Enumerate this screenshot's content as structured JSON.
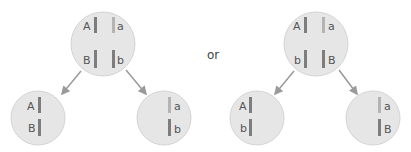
{
  "separator": "or",
  "colors": {
    "cell_fill": "#e6e6e6",
    "cell_stroke": "#d4d4d4",
    "chrom_dark": "#7d7d7d",
    "chrom_light": "#b4b4b4",
    "arrow": "#9a9a9a",
    "label": "#555555"
  },
  "left_diagram": {
    "parent": {
      "labels": [
        "A",
        "a",
        "B",
        "b"
      ]
    },
    "daughter_left": {
      "labels": [
        "A",
        "B"
      ]
    },
    "daughter_right": {
      "labels": [
        "a",
        "b"
      ]
    }
  },
  "right_diagram": {
    "parent": {
      "labels": [
        "A",
        "a",
        "b",
        "B"
      ]
    },
    "daughter_left": {
      "labels": [
        "A",
        "b"
      ]
    },
    "daughter_right": {
      "labels": [
        "a",
        "B"
      ]
    }
  }
}
